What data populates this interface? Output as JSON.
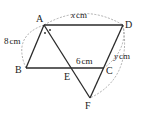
{
  "figure": {
    "type": "geometry",
    "points": {
      "A": {
        "label": "A",
        "x": 44,
        "y": 25
      },
      "B": {
        "label": "B",
        "x": 26,
        "y": 68
      },
      "C": {
        "label": "C",
        "x": 104,
        "y": 68
      },
      "D": {
        "label": "D",
        "x": 123,
        "y": 25
      },
      "E": {
        "label": "E",
        "x": 72,
        "y": 68
      },
      "F": {
        "label": "F",
        "x": 90,
        "y": 98
      }
    },
    "measures": {
      "AB": {
        "value": "8",
        "unit": "cm"
      },
      "AD": {
        "value": "x",
        "unit": "cm"
      },
      "EC": {
        "value": "6",
        "unit": "cm"
      },
      "DC": {
        "value": "y",
        "unit": "cm"
      }
    },
    "angle_marks": "two dots at A indicating equal angles (AE bisects angle BAD)",
    "colors": {
      "line": "#2a2a2a",
      "dashed": "#9a9a9a",
      "text": "#222222"
    }
  },
  "labels": {
    "A": "A",
    "B": "B",
    "C": "C",
    "D": "D",
    "E": "E",
    "F": "F",
    "ab_value": "8",
    "ad_value": "x",
    "ec_value": "6",
    "dc_value": "y",
    "unit": "cm"
  }
}
